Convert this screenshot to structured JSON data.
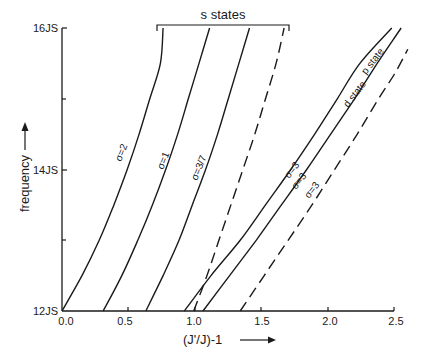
{
  "chart_data": {
    "type": "line",
    "title": "",
    "xlabel": "(J'/J)-1",
    "ylabel": "frequency",
    "xlim": [
      0,
      2.5
    ],
    "ylim": [
      12,
      16
    ],
    "grid": false,
    "x_ticks": [
      {
        "value": 0.0,
        "label": "0.0"
      },
      {
        "value": 0.5,
        "label": "0.5"
      },
      {
        "value": 1.0,
        "label": "1.0"
      },
      {
        "value": 1.5,
        "label": "1.5"
      },
      {
        "value": 2.0,
        "label": "2.0"
      },
      {
        "value": 2.5,
        "label": "2.5"
      }
    ],
    "y_ticks": [
      {
        "value": 12,
        "label": "12JS"
      },
      {
        "value": 13,
        "label": ""
      },
      {
        "value": 14,
        "label": "14JS"
      },
      {
        "value": 15,
        "label": ""
      },
      {
        "value": 16,
        "label": "16JS"
      }
    ],
    "annotations": {
      "bracket_label": "s states",
      "bracket_x": [
        0.71,
        1.71
      ],
      "p_state": "p state",
      "d_state": "d state"
    },
    "series": [
      {
        "name": "s state σ=2",
        "group": "s states",
        "label": "σ=2",
        "style": "solid",
        "points": [
          [
            0.0,
            12.0
          ],
          [
            0.15,
            12.5
          ],
          [
            0.28,
            13.0
          ],
          [
            0.39,
            13.5
          ],
          [
            0.49,
            14.0
          ],
          [
            0.58,
            14.5
          ],
          [
            0.66,
            15.0
          ],
          [
            0.74,
            15.5
          ],
          [
            0.76,
            16.0
          ]
        ]
      },
      {
        "name": "s state σ=1",
        "group": "s states",
        "label": "σ=1",
        "style": "solid",
        "points": [
          [
            0.31,
            12.0
          ],
          [
            0.45,
            12.5
          ],
          [
            0.57,
            13.0
          ],
          [
            0.68,
            13.5
          ],
          [
            0.78,
            14.0
          ],
          [
            0.87,
            14.5
          ],
          [
            0.95,
            15.0
          ],
          [
            1.03,
            15.5
          ],
          [
            1.11,
            16.0
          ]
        ]
      },
      {
        "name": "s state σ=3/7",
        "group": "s states",
        "label": "σ=3/7",
        "style": "solid",
        "points": [
          [
            0.63,
            12.0
          ],
          [
            0.76,
            12.5
          ],
          [
            0.88,
            13.0
          ],
          [
            0.98,
            13.5
          ],
          [
            1.08,
            14.0
          ],
          [
            1.17,
            14.5
          ],
          [
            1.25,
            15.0
          ],
          [
            1.33,
            15.5
          ],
          [
            1.41,
            16.0
          ]
        ]
      },
      {
        "name": "s state (dashed)",
        "group": "s states",
        "label": "",
        "style": "dashed",
        "points": [
          [
            0.99,
            12.0
          ],
          [
            1.09,
            12.5
          ],
          [
            1.18,
            13.0
          ],
          [
            1.27,
            13.5
          ],
          [
            1.36,
            14.0
          ],
          [
            1.45,
            14.5
          ],
          [
            1.53,
            15.0
          ],
          [
            1.61,
            15.5
          ],
          [
            1.67,
            16.0
          ]
        ]
      },
      {
        "name": "p state σ=3",
        "group": "p state",
        "label": "σ=3",
        "style": "solid",
        "points": [
          [
            0.92,
            12.0
          ],
          [
            1.12,
            12.5
          ],
          [
            1.34,
            13.0
          ],
          [
            1.53,
            13.5
          ],
          [
            1.72,
            14.0
          ],
          [
            1.9,
            14.5
          ],
          [
            2.07,
            15.0
          ],
          [
            2.24,
            15.5
          ],
          [
            2.48,
            16.0
          ]
        ]
      },
      {
        "name": "d state σ=3",
        "group": "d state",
        "label": "σ=3",
        "style": "solid",
        "points": [
          [
            1.06,
            12.0
          ],
          [
            1.26,
            12.5
          ],
          [
            1.46,
            13.0
          ],
          [
            1.65,
            13.5
          ],
          [
            1.84,
            14.0
          ],
          [
            2.02,
            14.5
          ],
          [
            2.2,
            15.0
          ],
          [
            2.37,
            15.5
          ],
          [
            2.55,
            16.0
          ]
        ]
      },
      {
        "name": "dashed σ=3",
        "group": "",
        "label": "σ=3",
        "style": "dashed",
        "points": [
          [
            1.34,
            12.0
          ],
          [
            1.52,
            12.5
          ],
          [
            1.7,
            13.0
          ],
          [
            1.88,
            13.5
          ],
          [
            2.05,
            14.0
          ],
          [
            2.22,
            14.5
          ],
          [
            2.38,
            15.0
          ],
          [
            2.5,
            15.35
          ],
          [
            2.6,
            15.7
          ]
        ]
      }
    ]
  },
  "labels": {
    "y16": "16JS",
    "y14": "14JS",
    "y12": "12JS",
    "x0": "0.0",
    "x05": "0.5",
    "x10": "1.0",
    "x15": "1.5",
    "x20": "2.0",
    "x25": "2.5",
    "xlabel": "(J'/J)-1",
    "ylabel": "frequency",
    "bracket": "s states",
    "sig2": "σ=2",
    "sig1": "σ=1",
    "sig37": "σ=3/7",
    "sig3a": "σ=3",
    "sig3b": "σ=3",
    "sig3c": "σ=3",
    "pstate": "p state",
    "dstate": "d state"
  }
}
